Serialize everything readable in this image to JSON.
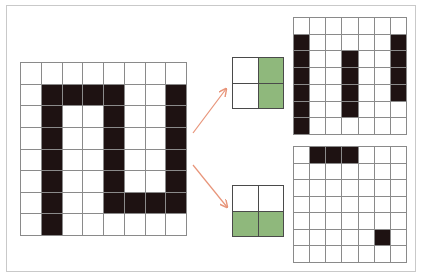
{
  "diagram": {
    "colors": {
      "frame": "#c9c9c9",
      "grid_line": "#8a8a8a",
      "filled_cell": "#1e1212",
      "kernel_filled": "#8fb87c",
      "arrow": "#e8957a"
    },
    "input_grid": {
      "rows": 8,
      "cols": 8,
      "cells": [
        [
          0,
          0,
          0,
          0,
          0,
          0,
          0,
          0
        ],
        [
          0,
          1,
          1,
          1,
          1,
          0,
          0,
          1
        ],
        [
          0,
          1,
          0,
          0,
          1,
          0,
          0,
          1
        ],
        [
          0,
          1,
          0,
          0,
          1,
          0,
          0,
          1
        ],
        [
          0,
          1,
          0,
          0,
          1,
          0,
          0,
          1
        ],
        [
          0,
          1,
          0,
          0,
          1,
          0,
          0,
          1
        ],
        [
          0,
          1,
          0,
          0,
          1,
          1,
          1,
          1
        ],
        [
          0,
          1,
          0,
          0,
          0,
          0,
          0,
          0
        ]
      ]
    },
    "kernels": [
      {
        "name": "vertical-edge-kernel",
        "rows": 2,
        "cols": 2,
        "cells": [
          [
            0,
            1
          ],
          [
            0,
            1
          ]
        ]
      },
      {
        "name": "horizontal-edge-kernel",
        "rows": 2,
        "cols": 2,
        "cells": [
          [
            0,
            0
          ],
          [
            1,
            1
          ]
        ]
      }
    ],
    "outputs": [
      {
        "name": "feature-map-vertical",
        "rows": 7,
        "cols": 7,
        "cells": [
          [
            0,
            0,
            0,
            0,
            0,
            0,
            0
          ],
          [
            1,
            0,
            0,
            0,
            0,
            0,
            1
          ],
          [
            1,
            0,
            0,
            1,
            0,
            0,
            1
          ],
          [
            1,
            0,
            0,
            1,
            0,
            0,
            1
          ],
          [
            1,
            0,
            0,
            1,
            0,
            0,
            1
          ],
          [
            1,
            0,
            0,
            1,
            0,
            0,
            0
          ],
          [
            1,
            0,
            0,
            0,
            0,
            0,
            0
          ]
        ]
      },
      {
        "name": "feature-map-horizontal",
        "rows": 7,
        "cols": 7,
        "cells": [
          [
            0,
            1,
            1,
            1,
            0,
            0,
            0
          ],
          [
            0,
            0,
            0,
            0,
            0,
            0,
            0
          ],
          [
            0,
            0,
            0,
            0,
            0,
            0,
            0
          ],
          [
            0,
            0,
            0,
            0,
            0,
            0,
            0
          ],
          [
            0,
            0,
            0,
            0,
            0,
            0,
            0
          ],
          [
            0,
            0,
            0,
            0,
            0,
            1,
            0
          ],
          [
            0,
            0,
            0,
            0,
            0,
            0,
            0
          ]
        ]
      }
    ],
    "arrows": [
      {
        "name": "arrow-to-top-kernel",
        "from": [
          193,
          133
        ],
        "to": [
          226,
          89
        ]
      },
      {
        "name": "arrow-to-bottom-kernel",
        "from": [
          193,
          165
        ],
        "to": [
          227,
          207
        ]
      }
    ]
  }
}
